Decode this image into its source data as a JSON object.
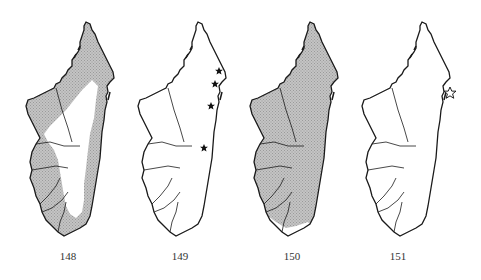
{
  "figure": {
    "maps": [
      {
        "number": "148",
        "fill": "partial-hatched",
        "description": "Range map: hatched coastal and western areas, unhatched central highlands"
      },
      {
        "number": "149",
        "fill": "none",
        "markers": [
          {
            "type": "filled-star",
            "location": "northeast coast"
          },
          {
            "type": "filled-star",
            "location": "northeast coast"
          },
          {
            "type": "filled-star",
            "location": "east coast"
          },
          {
            "type": "filled-star",
            "location": "east-central interior"
          }
        ]
      },
      {
        "number": "150",
        "fill": "mostly-hatched",
        "description": "Range map: nearly whole island hatched except southern tip"
      },
      {
        "number": "151",
        "fill": "none",
        "markers": [
          {
            "type": "open-star",
            "location": "east coast"
          }
        ]
      }
    ]
  },
  "colors": {
    "outline": "#1a1a1a",
    "hatch": "#b8b8b8",
    "background": "#ffffff"
  }
}
